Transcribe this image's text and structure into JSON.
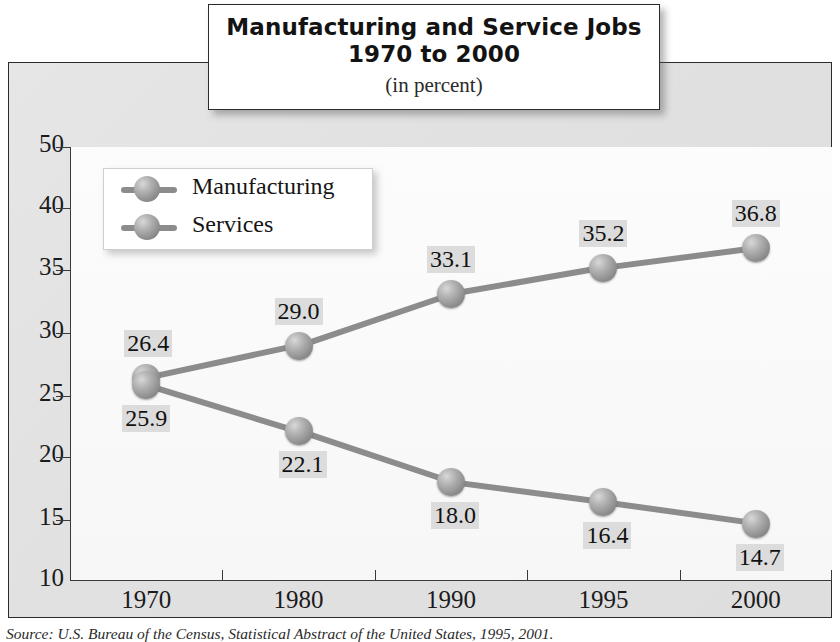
{
  "title": {
    "line1": "Manufacturing and Service Jobs",
    "line2": "1970 to 2000",
    "subtitle": "(in percent)"
  },
  "legend": {
    "items": [
      {
        "label": "Manufacturing",
        "marker": "sphere-marker-icon"
      },
      {
        "label": "Services",
        "marker": "sphere-marker-icon"
      }
    ]
  },
  "axes": {
    "y_ticks": [
      "50",
      "40",
      "35",
      "30",
      "25",
      "20",
      "15",
      "10"
    ],
    "x_ticks": [
      "1970",
      "1980",
      "1990",
      "1995",
      "2000"
    ]
  },
  "source": {
    "prefix": "Source:",
    "text": " U.S. Bureau of the Census, Statistical Abstract of the United States, 1995, 2001."
  },
  "chart_data": {
    "type": "line",
    "title": "Manufacturing and Service Jobs 1970 to 2000",
    "subtitle": "(in percent)",
    "xlabel": "",
    "ylabel": "",
    "categories": [
      "1970",
      "1980",
      "1990",
      "1995",
      "2000"
    ],
    "ylim": [
      10,
      50
    ],
    "y_tick_values": [
      50,
      40,
      35,
      30,
      25,
      20,
      15,
      10
    ],
    "grid": false,
    "legend_position": "upper-left",
    "series": [
      {
        "name": "Services",
        "values": [
          26.4,
          29.0,
          33.1,
          35.2,
          36.8
        ],
        "labels": [
          "26.4",
          "29.0",
          "33.1",
          "35.2",
          "36.8"
        ],
        "color": "#8c8c8c"
      },
      {
        "name": "Manufacturing",
        "values": [
          25.9,
          22.1,
          18.0,
          16.4,
          14.7
        ],
        "labels": [
          "25.9",
          "22.1",
          "18.0",
          "16.4",
          "14.7"
        ],
        "color": "#8c8c8c"
      }
    ]
  }
}
